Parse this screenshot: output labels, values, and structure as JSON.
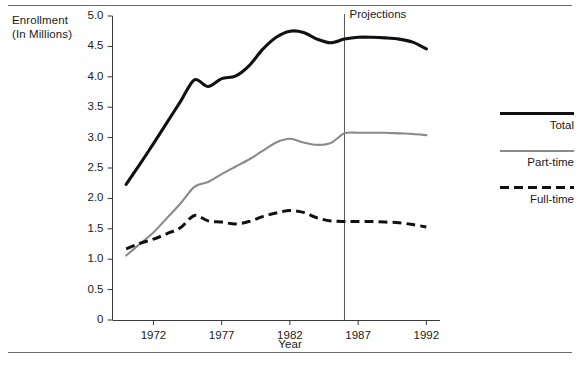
{
  "figure": {
    "y_axis_title": "Enrollment\n(In Millions)",
    "x_axis_title": "Year",
    "projections_label": "Projections"
  },
  "legend": {
    "position": "right",
    "entries": [
      {
        "label": "Total",
        "style": "solid-thick",
        "color": "#111111",
        "key": "total"
      },
      {
        "label": "Part-time",
        "style": "solid-thin",
        "color": "#8a8a8a",
        "key": "part_time"
      },
      {
        "label": "Full-time",
        "style": "dashed",
        "color": "#111111",
        "key": "full_time"
      }
    ]
  },
  "chart_data": {
    "type": "line",
    "title": "",
    "xlabel": "Year",
    "ylabel": "Enrollment (In Millions)",
    "xlim": [
      1969,
      1993
    ],
    "ylim": [
      0,
      5.0
    ],
    "xticks": [
      1972,
      1977,
      1982,
      1987,
      1992
    ],
    "xtick_labels": [
      "1972",
      "1977",
      "1982",
      "1987",
      "1992"
    ],
    "yticks": [
      0,
      0.5,
      1.0,
      1.5,
      2.0,
      2.5,
      3.0,
      3.5,
      4.0,
      4.5,
      5.0
    ],
    "ytick_labels": [
      "0",
      "0.5",
      "1.0",
      "1.5",
      "2.0",
      "2.5",
      "3.0",
      "3.5",
      "4.0",
      "4.5",
      "5.0"
    ],
    "grid": false,
    "annotations": [
      {
        "text": "Projections",
        "type": "vline",
        "x": 1986.0
      }
    ],
    "x": [
      1970,
      1971,
      1972,
      1973,
      1974,
      1975,
      1976,
      1977,
      1978,
      1979,
      1980,
      1981,
      1982,
      1983,
      1984,
      1985,
      1986,
      1987,
      1988,
      1989,
      1990,
      1991,
      1992
    ],
    "series": [
      {
        "name": "Total",
        "color": "#111111",
        "style": "solid-thick",
        "values": [
          2.23,
          2.56,
          2.9,
          3.25,
          3.6,
          3.95,
          3.84,
          3.97,
          4.01,
          4.18,
          4.45,
          4.65,
          4.75,
          4.73,
          4.62,
          4.56,
          4.62,
          4.65,
          4.65,
          4.64,
          4.62,
          4.57,
          4.46
        ]
      },
      {
        "name": "Part-time",
        "color": "#8a8a8a",
        "style": "solid-thin",
        "values": [
          1.06,
          1.25,
          1.44,
          1.68,
          1.92,
          2.19,
          2.27,
          2.4,
          2.52,
          2.64,
          2.78,
          2.92,
          2.98,
          2.92,
          2.88,
          2.91,
          3.07,
          3.08,
          3.08,
          3.08,
          3.07,
          3.06,
          3.04
        ]
      },
      {
        "name": "Full-time",
        "color": "#111111",
        "style": "dashed",
        "values": [
          1.17,
          1.26,
          1.33,
          1.42,
          1.52,
          1.72,
          1.63,
          1.61,
          1.58,
          1.62,
          1.7,
          1.76,
          1.8,
          1.77,
          1.68,
          1.63,
          1.62,
          1.62,
          1.62,
          1.61,
          1.6,
          1.57,
          1.53
        ]
      }
    ]
  }
}
